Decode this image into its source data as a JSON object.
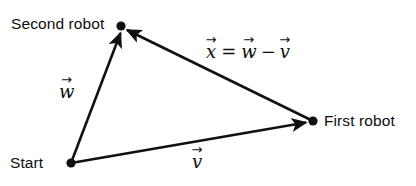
{
  "figure": {
    "type": "vector-diagram",
    "background_color": "#ffffff",
    "stroke_color": "#111111",
    "width": 416,
    "height": 186
  },
  "nodes": [
    {
      "id": "start",
      "label": "Start",
      "x": 71,
      "y": 163,
      "label_side": "left"
    },
    {
      "id": "second_robot",
      "label": "Second robot",
      "x": 121,
      "y": 26,
      "label_side": "left"
    },
    {
      "id": "first_robot",
      "label": "First robot",
      "x": 313,
      "y": 121,
      "label_side": "right"
    }
  ],
  "vectors": [
    {
      "id": "w",
      "symbol": "w",
      "arrow_accent": "→",
      "from": "start",
      "to": "second_robot",
      "label_x": 59,
      "label_y": 83
    },
    {
      "id": "v",
      "symbol": "v",
      "arrow_accent": "→",
      "from": "start",
      "to": "first_robot",
      "label_x": 192,
      "label_y": 153
    },
    {
      "id": "x",
      "symbol": "x",
      "arrow_accent": "→",
      "from": "first_robot",
      "to": "second_robot",
      "label_x": 206,
      "label_y": 43
    }
  ],
  "equation": {
    "lhs": "x",
    "equals": "=",
    "term1": "w",
    "operator": "−",
    "term2": "v",
    "accent": "→",
    "plain_text": "x⃗ = w⃗ − v⃗"
  },
  "labels": {
    "second_robot": "Second robot",
    "first_robot": "First robot",
    "start": "Start",
    "w": "w",
    "v": "v",
    "x": "x"
  }
}
